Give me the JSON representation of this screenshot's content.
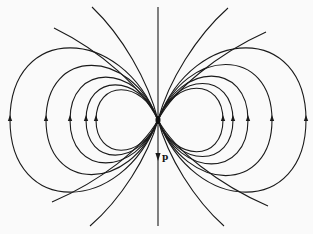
{
  "diagram": {
    "center": [
      158,
      120
    ],
    "colors": {
      "stroke": "#1a1a1a",
      "background": "#fafafa"
    },
    "dipole_label": "p",
    "label_pos": [
      162,
      160
    ],
    "axis": {
      "top": 7,
      "bottom": 226
    },
    "dipole_arrow": {
      "from": 120,
      "to": 156
    },
    "loops_right": [
      65,
      75,
      90,
      114,
      148
    ],
    "loops_left": [
      62,
      72,
      88,
      112,
      148
    ],
    "loop_halfheight_ratio": 0.52,
    "open_lines": [
      {
        "side": "tr",
        "end": [
          228,
          8
        ]
      },
      {
        "side": "tl",
        "end": [
          92,
          7
        ]
      },
      {
        "side": "br",
        "end": [
          224,
          226
        ]
      },
      {
        "side": "bl",
        "end": [
          90,
          226
        ]
      },
      {
        "side": "tr",
        "end": [
          266,
          32
        ]
      },
      {
        "side": "tl",
        "end": [
          54,
          28
        ]
      },
      {
        "side": "br",
        "end": [
          268,
          206
        ]
      },
      {
        "side": "bl",
        "end": [
          52,
          202
        ]
      }
    ]
  }
}
